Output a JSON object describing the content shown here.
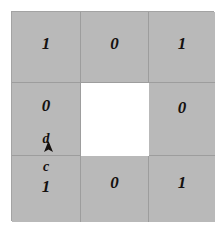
{
  "figure": {
    "title": "",
    "type": "square-annulus-cell-grid",
    "background_color": "#ffffff",
    "cell_fill_color": "#b9b9b9",
    "hole_fill_color": "#ffffff",
    "border_color": "#9d9d9d",
    "text_color": "#15110f"
  },
  "grid": {
    "rows": 3,
    "columns": 3,
    "cells": [
      {
        "position": "top-left",
        "value": "1",
        "filled": true
      },
      {
        "position": "top-middle",
        "value": "0",
        "filled": true
      },
      {
        "position": "top-right",
        "value": "1",
        "filled": true
      },
      {
        "position": "middle-left",
        "value": "0",
        "filled": true
      },
      {
        "position": "center",
        "value": "",
        "filled": false
      },
      {
        "position": "middle-right",
        "value": "0",
        "filled": true
      },
      {
        "position": "bottom-left",
        "value": "1",
        "filled": true
      },
      {
        "position": "bottom-middle",
        "value": "0",
        "filled": true
      },
      {
        "position": "bottom-right",
        "value": "1",
        "filled": true
      }
    ]
  },
  "annotations": {
    "label_d": "d",
    "label_c": "c",
    "arrow": "up-arrow-marker"
  }
}
